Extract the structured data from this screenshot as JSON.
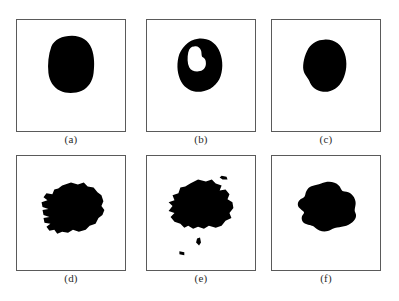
{
  "figure": {
    "name": "binary-segmentation-mask-grid",
    "background_color": "#ffffff",
    "border_color": "#5a5a5a",
    "mask_color": "#000000",
    "hole_color": "#ffffff",
    "rows": 2,
    "columns": 3,
    "width_px": 399,
    "height_px": 301
  },
  "panels": [
    {
      "id": "a",
      "caption": "(a)",
      "row": 1,
      "column": 1,
      "box": {
        "x": 16,
        "y": 19,
        "w": 110,
        "h": 113
      },
      "caption_box": {
        "x": 16,
        "y": 133,
        "w": 110,
        "h": 14
      },
      "content": {
        "type": "binary-mask",
        "shape": "smooth-rounded-blob",
        "region_count": 1,
        "hole_count": 0,
        "speck_count": 0,
        "orientation": "vertical-oval",
        "centroid_pct": {
          "x": 51,
          "y": 41
        },
        "approx_area_pct": 13
      }
    },
    {
      "id": "b",
      "caption": "(b)",
      "row": 1,
      "column": 2,
      "box": {
        "x": 146,
        "y": 19,
        "w": 110,
        "h": 113
      },
      "caption_box": {
        "x": 146,
        "y": 133,
        "w": 110,
        "h": 14
      },
      "content": {
        "type": "binary-mask",
        "shape": "irregular-blob-with-interior-hole",
        "region_count": 1,
        "hole_count": 1,
        "speck_count": 0,
        "orientation": "vertical-oval",
        "centroid_pct": {
          "x": 48,
          "y": 40
        },
        "approx_area_pct": 9
      }
    },
    {
      "id": "c",
      "caption": "(c)",
      "row": 1,
      "column": 3,
      "box": {
        "x": 271,
        "y": 19,
        "w": 110,
        "h": 113
      },
      "caption_box": {
        "x": 271,
        "y": 133,
        "w": 110,
        "h": 14
      },
      "content": {
        "type": "binary-mask",
        "shape": "smooth-rounded-blob",
        "region_count": 1,
        "hole_count": 0,
        "speck_count": 0,
        "orientation": "vertical-oval",
        "centroid_pct": {
          "x": 47,
          "y": 42
        },
        "approx_area_pct": 12
      }
    },
    {
      "id": "d",
      "caption": "(d)",
      "row": 2,
      "column": 1,
      "box": {
        "x": 16,
        "y": 155,
        "w": 110,
        "h": 116
      },
      "caption_box": {
        "x": 16,
        "y": 272,
        "w": 110,
        "h": 14
      },
      "content": {
        "type": "binary-mask",
        "shape": "jagged-blob-with-left-notches",
        "region_count": 1,
        "hole_count": 0,
        "speck_count": 0,
        "orientation": "horizontal-irregular",
        "centroid_pct": {
          "x": 50,
          "y": 48
        },
        "approx_area_pct": 22
      }
    },
    {
      "id": "e",
      "caption": "(e)",
      "row": 2,
      "column": 2,
      "box": {
        "x": 146,
        "y": 155,
        "w": 110,
        "h": 116
      },
      "caption_box": {
        "x": 146,
        "y": 272,
        "w": 110,
        "h": 14
      },
      "content": {
        "type": "binary-mask",
        "shape": "jagged-blob-with-satellite-specks",
        "region_count": 4,
        "hole_count": 0,
        "speck_count": 3,
        "orientation": "horizontal-irregular",
        "centroid_pct": {
          "x": 48,
          "y": 45
        },
        "approx_area_pct": 24
      }
    },
    {
      "id": "f",
      "caption": "(f)",
      "row": 2,
      "column": 3,
      "box": {
        "x": 271,
        "y": 155,
        "w": 110,
        "h": 116
      },
      "caption_box": {
        "x": 271,
        "y": 272,
        "w": 110,
        "h": 14
      },
      "content": {
        "type": "binary-mask",
        "shape": "smoothed-jagged-blob",
        "region_count": 1,
        "hole_count": 0,
        "speck_count": 0,
        "orientation": "horizontal-irregular",
        "centroid_pct": {
          "x": 49,
          "y": 46
        },
        "approx_area_pct": 23
      }
    }
  ]
}
